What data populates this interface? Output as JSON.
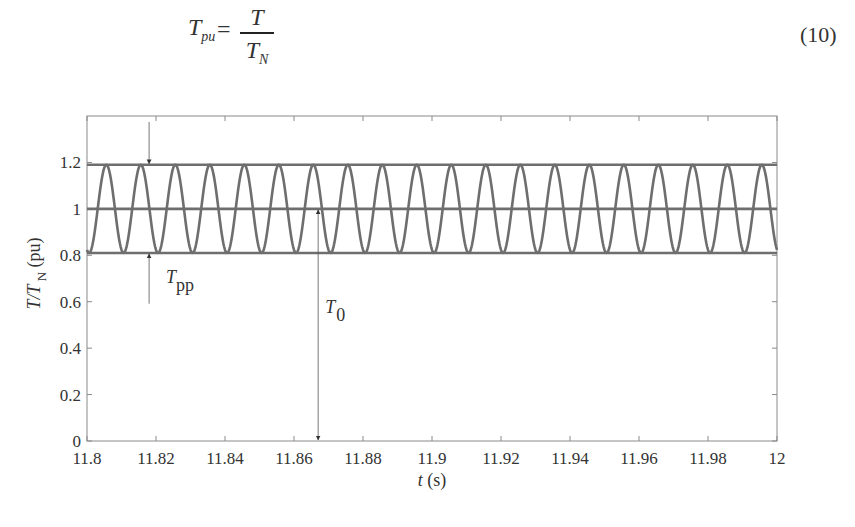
{
  "equation": {
    "lhs_symbol": "T",
    "lhs_subscript": "pu",
    "equals": "=",
    "numerator": "T",
    "denominator_symbol": "T",
    "denominator_subscript": "N",
    "number": "(10)"
  },
  "chart_data": {
    "type": "line",
    "title": "",
    "xlabel": "t (s)",
    "ylabel": "T/T_N (pu)",
    "xlim": [
      11.8,
      12.0
    ],
    "ylim": [
      0,
      1.4
    ],
    "xticks": [
      "11.8",
      "11.82",
      "11.84",
      "11.86",
      "11.88",
      "11.9",
      "11.92",
      "11.94",
      "11.96",
      "11.98",
      "12"
    ],
    "yticks": [
      "0",
      "0.2",
      "0.4",
      "0.6",
      "0.8",
      "1",
      "1.2"
    ],
    "grid": false,
    "legend": null,
    "series": [
      {
        "name": "torque",
        "kind": "sinusoid",
        "mean": 1.0,
        "amplitude": 0.19,
        "frequency_hz": 100,
        "trough_time": 11.8006,
        "x_range": [
          11.8,
          12.0
        ]
      },
      {
        "name": "upper envelope",
        "kind": "constant",
        "value": 1.19
      },
      {
        "name": "mean",
        "kind": "constant",
        "value": 1.0
      },
      {
        "name": "lower envelope",
        "kind": "constant",
        "value": 0.81
      }
    ],
    "annotations": [
      {
        "label": "T",
        "subscript": "pp",
        "description": "peak-to-peak torque arrows",
        "x": 11.818,
        "from": 0.81,
        "to": 1.19
      },
      {
        "label": "T",
        "subscript": "0",
        "description": "mean torque arrow",
        "x": 11.867,
        "from": 0,
        "to": 1.0
      }
    ]
  },
  "colors": {
    "trace": "#6e6e6e",
    "axis": "#8a8a8a",
    "text": "#333333"
  }
}
